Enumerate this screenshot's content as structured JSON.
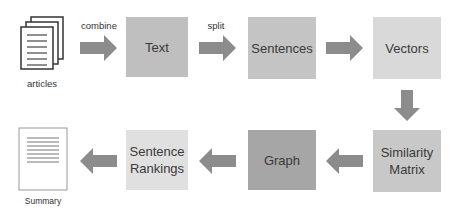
{
  "diagram": {
    "inputs": {
      "articles_label": "articles"
    },
    "output": {
      "summary_label": "Summary"
    },
    "edges": {
      "combine_label": "combine",
      "split_label": "split"
    },
    "nodes": [
      {
        "id": "text",
        "label": "Text",
        "color": "#bfbfbf"
      },
      {
        "id": "sentences",
        "label": "Sentences",
        "color": "#c4c4c4"
      },
      {
        "id": "vectors",
        "label": "Vectors",
        "color": "#d9d9d9"
      },
      {
        "id": "similarity",
        "label_line1": "Similarity",
        "label_line2": "Matrix",
        "color": "#c8c8c8"
      },
      {
        "id": "graph",
        "label": "Graph",
        "color": "#a6a6a6"
      },
      {
        "id": "rankings",
        "label_line1": "Sentence",
        "label_line2": "Rankings",
        "color": "#e0e0e0"
      }
    ],
    "arrow_color": "#8c8c8c"
  }
}
